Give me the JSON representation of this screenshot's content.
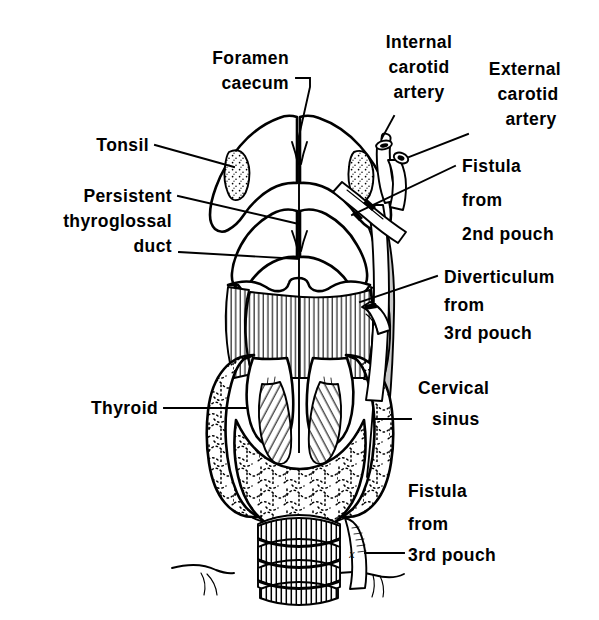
{
  "figure": {
    "background_color": "#ffffff",
    "ink_color": "#000000",
    "sinus_tract_color": "#c9c9c9",
    "width": 599,
    "height": 620
  },
  "labels": {
    "foramen_caecum": {
      "line1": "Foramen",
      "line2": "caecum"
    },
    "tonsil": {
      "line1": "Tonsil"
    },
    "persistent_thyroglossal_duct": {
      "line1": "Persistent",
      "line2": "thyroglossal",
      "line3": "duct"
    },
    "thyroid": {
      "line1": "Thyroid"
    },
    "internal_carotid_artery": {
      "line1": "Internal",
      "line2": "carotid",
      "line3": "artery"
    },
    "external_carotid_artery": {
      "line1": "External",
      "line2": "carotid",
      "line3": "artery"
    },
    "fistula_2nd_pouch": {
      "line1": "Fistula",
      "line2": "from",
      "line3": "2nd pouch"
    },
    "diverticulum_3rd_pouch": {
      "line1": "Diverticulum",
      "line2": "from",
      "line3": "3rd pouch"
    },
    "cervical_sinus": {
      "line1": "Cervical",
      "line2": "sinus"
    },
    "fistula_3rd_pouch": {
      "line1": "Fistula",
      "line2": "from",
      "line3": "3rd pouch"
    },
    "external_opening_marker": {
      "text": "x"
    }
  }
}
